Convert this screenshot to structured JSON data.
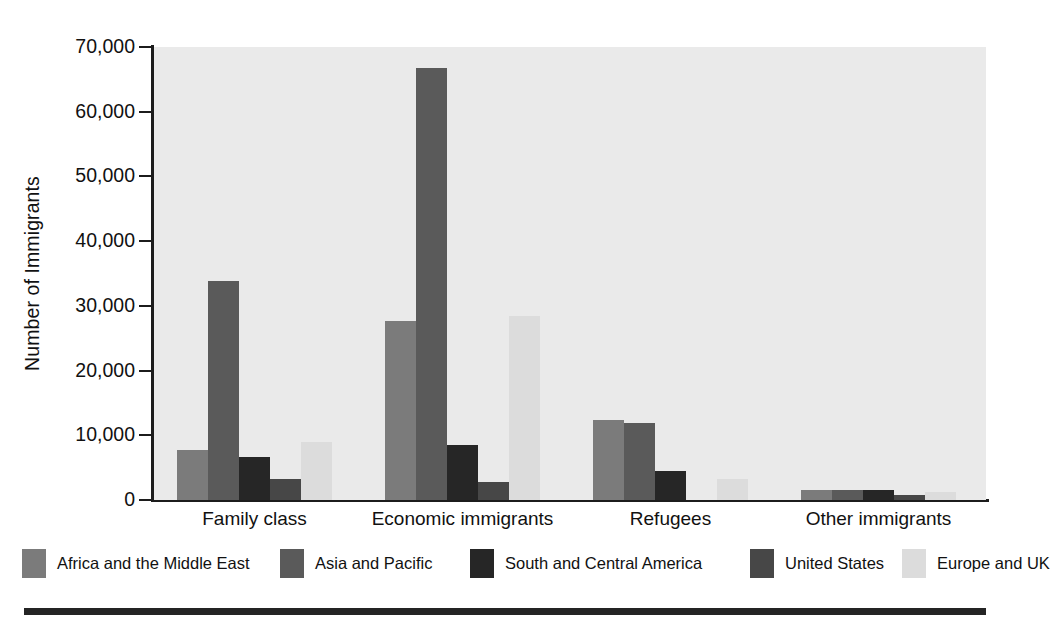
{
  "chart_data": {
    "type": "bar",
    "title": "",
    "xlabel": "",
    "ylabel": "Number of Immigrants",
    "ylim": [
      0,
      70000
    ],
    "ytick_labels": [
      "70,000",
      "60,000",
      "50,000",
      "40,000",
      "30,000",
      "20,000",
      "10,000",
      "0"
    ],
    "ytick_values": [
      70000,
      60000,
      50000,
      40000,
      30000,
      20000,
      10000,
      0
    ],
    "grid": false,
    "legend_position": "bottom",
    "categories": [
      "Family class",
      "Economic immigrants",
      "Refugees",
      "Other immigrants"
    ],
    "series": [
      {
        "name": "Africa and the Middle East",
        "color": "#7b7b7b",
        "values": [
          7700,
          27600,
          12400,
          1500
        ]
      },
      {
        "name": "Asia and Pacific",
        "color": "#5a5a5a",
        "values": [
          33900,
          66700,
          11900,
          1500
        ]
      },
      {
        "name": "South and Central America",
        "color": "#262626",
        "values": [
          6600,
          8500,
          4500,
          1500
        ]
      },
      {
        "name": "United States",
        "color": "#474747",
        "values": [
          3300,
          2800,
          0,
          700
        ]
      },
      {
        "name": "Europe and UK",
        "color": "#dcdcdc",
        "values": [
          8900,
          28400,
          3300,
          1200
        ]
      }
    ]
  },
  "colors": {
    "plot_background": "#eaeaea",
    "axis": "#1c1c1c",
    "text": "#111111",
    "rule": "#242424"
  }
}
